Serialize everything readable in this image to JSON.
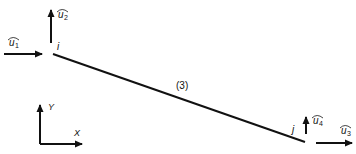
{
  "diagram": {
    "element_label": "(3)",
    "nodes": [
      {
        "id": "i",
        "label": "i"
      },
      {
        "id": "j",
        "label": "j"
      }
    ],
    "dofs": [
      {
        "symbol": "u",
        "sub": "1",
        "direction": "x",
        "node": "i"
      },
      {
        "symbol": "u",
        "sub": "2",
        "direction": "y",
        "node": "i"
      },
      {
        "symbol": "u",
        "sub": "3",
        "direction": "x",
        "node": "j"
      },
      {
        "symbol": "u",
        "sub": "4",
        "direction": "y",
        "node": "j"
      }
    ],
    "axes": {
      "x_label": "X",
      "y_label": "Y"
    },
    "line_color": "#111111"
  }
}
